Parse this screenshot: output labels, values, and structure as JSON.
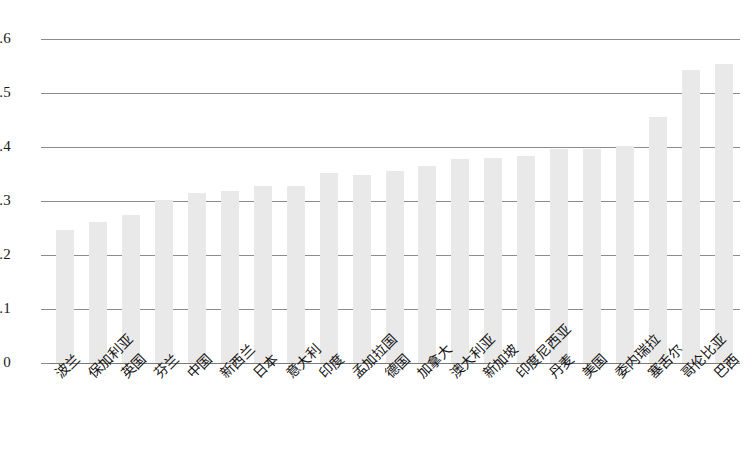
{
  "chart_data": {
    "type": "bar",
    "title": "",
    "xlabel": "",
    "ylabel": "",
    "ylim": [
      0,
      0.6
    ],
    "grid": true,
    "legend": "none",
    "yticks": [
      "0",
      "0.1",
      "0.2",
      "0.3",
      "0.4",
      "0.5",
      "0.6"
    ],
    "ytick_values": [
      0,
      0.1,
      0.2,
      0.3,
      0.4,
      0.5,
      0.6
    ],
    "categories": [
      "波兰",
      "保加利亚",
      "英国",
      "芬兰",
      "中国",
      "新西兰",
      "日本",
      "意大利",
      "印度",
      "孟加拉国",
      "德国",
      "加拿大",
      "澳大利亚",
      "新加坡",
      "印度尼西亚",
      "丹麦",
      "美国",
      "委内瑞拉",
      "塞舌尔",
      "哥伦比亚",
      "巴西"
    ],
    "values": [
      0.246,
      0.261,
      0.275,
      0.301,
      0.315,
      0.318,
      0.327,
      0.328,
      0.351,
      0.348,
      0.355,
      0.364,
      0.378,
      0.379,
      0.383,
      0.397,
      0.397,
      0.402,
      0.455,
      0.543,
      0.553
    ],
    "bar_color": "#e9e9e9",
    "gridline_color": "#8c8c8c",
    "axis_color": "#7a7a7a",
    "background_color": "#ffffff"
  }
}
